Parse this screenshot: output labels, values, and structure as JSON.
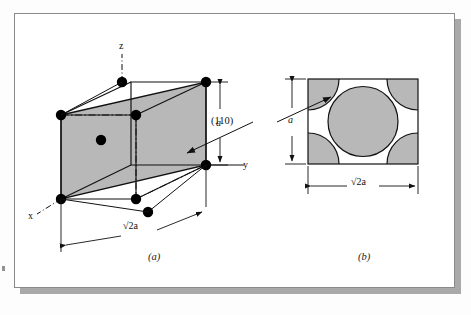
{
  "figure": {
    "kind": "crystallography-diagram",
    "panels": [
      {
        "id": "a",
        "caption": "(a)",
        "type": "unit-cell-3d",
        "axis_labels": {
          "x": "x",
          "y": "y",
          "z": "z"
        },
        "plane_label": "(110)",
        "dimensions": [
          {
            "name": "height",
            "label": "a"
          },
          {
            "name": "diagonal-width",
            "label": "√2a"
          }
        ],
        "atom_count": 9,
        "center_atom": true
      },
      {
        "id": "b",
        "caption": "(b)",
        "type": "atomic-packing-plan",
        "dimensions": [
          {
            "name": "height",
            "label": "a"
          },
          {
            "name": "width",
            "label": "√2a"
          }
        ],
        "corner_atoms": 4,
        "center_atoms": 1
      }
    ],
    "colors": {
      "plane_fill": "#b8b8b8",
      "atom_fill": "#000000",
      "line": "#111111",
      "frame_border": "#8a8a8a",
      "shadow": "#a9a9a9",
      "page_background": "#fdfdfd"
    }
  }
}
